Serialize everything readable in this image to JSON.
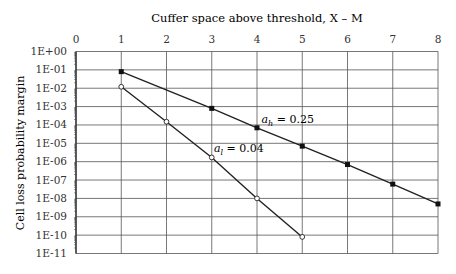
{
  "chart_data": {
    "type": "line",
    "title": "Cuffer space above threshold, X – M",
    "xlabel": "Cuffer space above threshold, X – M",
    "ylabel": "Cell loss probability margin",
    "x_ticks": [
      "0",
      "1",
      "2",
      "3",
      "4",
      "5",
      "6",
      "7",
      "8"
    ],
    "xlim": [
      0,
      8
    ],
    "y_ticks": [
      "1E+00",
      "1E-01",
      "1E-02",
      "1E-03",
      "1E-04",
      "1E-05",
      "1E-06",
      "1E-07",
      "1E-08",
      "1E-09",
      "1E-10",
      "1E-11"
    ],
    "ylim": [
      1e-11,
      1
    ],
    "yscale": "log",
    "grid": true,
    "x_axis_position": "top",
    "series": [
      {
        "name": "a_h = 0.25",
        "marker": "filled-square",
        "x": [
          1,
          3,
          4,
          5,
          6,
          7,
          8
        ],
        "y": [
          0.08,
          0.0008,
          7e-05,
          7e-06,
          7e-07,
          6e-08,
          5e-09
        ],
        "annotation": {
          "main": "a",
          "sub": "h",
          "rest": " = 0.25",
          "x": 4.1,
          "y": 0.00013
        }
      },
      {
        "name": "a_l = 0.04",
        "marker": "open-circle",
        "x": [
          1,
          2,
          3,
          4,
          5
        ],
        "y": [
          0.012,
          0.00015,
          1.7e-06,
          1e-08,
          8e-11
        ],
        "annotation": {
          "main": "a",
          "sub": "l",
          "rest": " = 0.04",
          "x": 3.05,
          "y": 3.5e-06
        }
      }
    ]
  }
}
